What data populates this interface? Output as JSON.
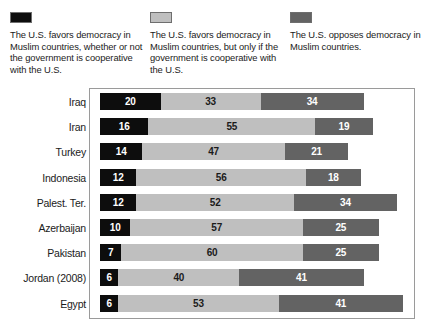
{
  "legend": {
    "items": [
      {
        "swatch_color": "#0d0d0d",
        "swatch_name": "legend-swatch-favors-always",
        "text": "The U.S. favors democracy in Muslim countries, whether or not the government is cooperative with the U.S."
      },
      {
        "swatch_color": "#bfbfbf",
        "swatch_name": "legend-swatch-favors-conditional",
        "text": "The U.S. favors democracy in Muslim countries, but only if the government is cooperative with the U.S."
      },
      {
        "swatch_color": "#636363",
        "swatch_name": "legend-swatch-opposes",
        "text": "The U.S. opposes democracy in Muslim countries."
      }
    ]
  },
  "chart_data": {
    "type": "bar",
    "orientation": "horizontal",
    "stacked": true,
    "title": "",
    "subtitle": "",
    "xlabel": "",
    "ylabel": "",
    "xlim": [
      0,
      105
    ],
    "grid": false,
    "legend_position": "top",
    "categories": [
      "Iraq",
      "Iran",
      "Turkey",
      "Indonesia",
      "Palest. Ter.",
      "Azerbaijan",
      "Pakistan",
      "Jordan (2008)",
      "Egypt"
    ],
    "series": [
      {
        "name": "The U.S. favors democracy in Muslim countries, whether or not the government is cooperative with the U.S.",
        "color": "#0d0d0d",
        "values": [
          20,
          16,
          14,
          12,
          12,
          10,
          7,
          6,
          6
        ]
      },
      {
        "name": "The U.S. favors democracy in Muslim countries, but only if the government is cooperative with the U.S.",
        "color": "#bfbfbf",
        "values": [
          33,
          55,
          47,
          56,
          52,
          57,
          60,
          40,
          53
        ]
      },
      {
        "name": "The U.S. opposes democracy in Muslim countries.",
        "color": "#636363",
        "values": [
          34,
          19,
          21,
          18,
          34,
          25,
          25,
          41,
          41
        ]
      }
    ],
    "rows": [
      {
        "category": "Iraq",
        "values": [
          20,
          33,
          34
        ]
      },
      {
        "category": "Iran",
        "values": [
          16,
          55,
          19
        ]
      },
      {
        "category": "Turkey",
        "values": [
          14,
          47,
          21
        ]
      },
      {
        "category": "Indonesia",
        "values": [
          12,
          56,
          18
        ]
      },
      {
        "category": "Palest. Ter.",
        "values": [
          12,
          52,
          34
        ]
      },
      {
        "category": "Azerbaijan",
        "values": [
          10,
          57,
          25
        ]
      },
      {
        "category": "Pakistan",
        "values": [
          7,
          60,
          25
        ]
      },
      {
        "category": "Jordan (2008)",
        "values": [
          6,
          40,
          41
        ]
      },
      {
        "category": "Egypt",
        "values": [
          6,
          53,
          41
        ]
      }
    ]
  }
}
